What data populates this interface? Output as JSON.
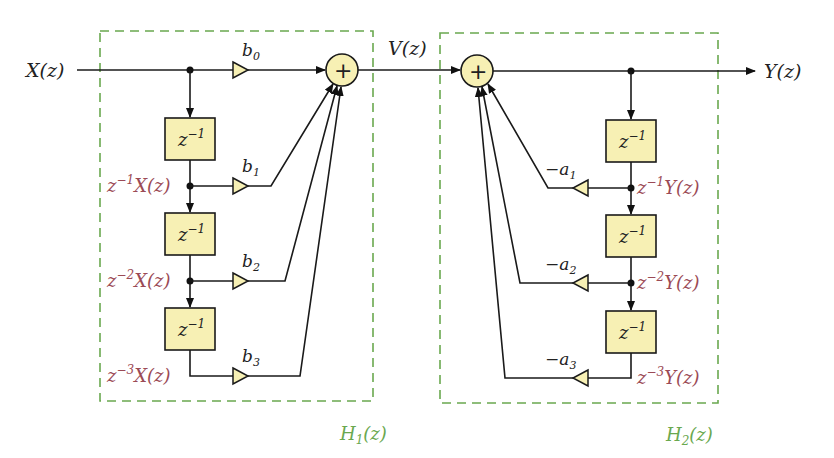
{
  "diagram": {
    "type": "block-diagram",
    "input_label": "X(z)",
    "intermediate_label": "V(z)",
    "output_label": "Y(z)",
    "sum_symbol": "+",
    "delay_label": "z",
    "delay_exp": "−1",
    "sections": [
      {
        "name": "H1",
        "label": "H",
        "label_sub": "1",
        "label_tail": "(z)",
        "gains": [
          {
            "sym": "b",
            "sub": "0"
          },
          {
            "sym": "b",
            "sub": "1"
          },
          {
            "sym": "b",
            "sub": "2"
          },
          {
            "sym": "b",
            "sub": "3"
          }
        ],
        "signals": [
          {
            "pre": "z",
            "exp": "−1",
            "post": "X(z)"
          },
          {
            "pre": "z",
            "exp": "−2",
            "post": "X(z)"
          },
          {
            "pre": "z",
            "exp": "−3",
            "post": "X(z)"
          }
        ]
      },
      {
        "name": "H2",
        "label": "H",
        "label_sub": "2",
        "label_tail": "(z)",
        "gains": [
          {
            "sym": "−a",
            "sub": "1"
          },
          {
            "sym": "−a",
            "sub": "2"
          },
          {
            "sym": "−a",
            "sub": "3"
          }
        ],
        "signals": [
          {
            "pre": "z",
            "exp": "−1",
            "post": "Y(z)"
          },
          {
            "pre": "z",
            "exp": "−2",
            "post": "Y(z)"
          },
          {
            "pre": "z",
            "exp": "−3",
            "post": "Y(z)"
          }
        ]
      }
    ],
    "colors": {
      "block_fill": "#f7f0b4",
      "group_border": "#6aa84f",
      "signal_label": "#9b4a55",
      "wire": "#1a1a1a"
    }
  }
}
